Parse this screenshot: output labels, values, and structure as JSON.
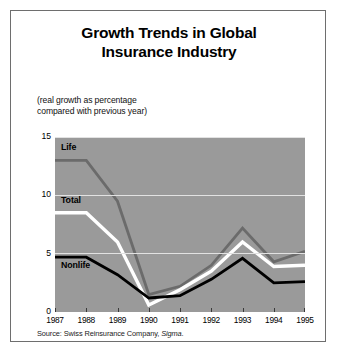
{
  "title_line1": "Growth Trends in Global",
  "title_line2": "Insurance Industry",
  "subtitle_line1": "(real growth as percentage",
  "subtitle_line2": "compared with previous year)",
  "source_prefix": "Source: Swiss Reinsurance Company, ",
  "source_italic": "Sigma",
  "source_suffix": ".",
  "labels": {
    "life": "Life",
    "total": "Total",
    "nonlife": "Nonlife"
  },
  "chart_data": {
    "type": "line",
    "title": "Growth Trends in Global Insurance Industry",
    "subtitle": "(real growth as percentage compared with previous year)",
    "xlabel": "",
    "ylabel": "",
    "categories": [
      "1987",
      "1988",
      "1989",
      "1990",
      "1991",
      "1992",
      "1993",
      "1994",
      "1995"
    ],
    "ylim": [
      0,
      15
    ],
    "yticks": [
      0,
      5,
      10,
      15
    ],
    "grid": true,
    "legend": "inline-labels",
    "plot_background": "#9a9a9a",
    "series": [
      {
        "name": "Life",
        "color": "#6b6b6b",
        "values": [
          13.0,
          13.0,
          9.5,
          1.5,
          2.2,
          4.0,
          7.2,
          4.3,
          5.2
        ]
      },
      {
        "name": "Total",
        "color": "#ffffff",
        "values": [
          8.5,
          8.5,
          6.0,
          0.6,
          1.9,
          3.5,
          6.0,
          3.9,
          4.0
        ]
      },
      {
        "name": "Nonlife",
        "color": "#000000",
        "values": [
          4.7,
          4.7,
          3.2,
          1.2,
          1.4,
          2.8,
          4.6,
          2.5,
          2.6
        ]
      }
    ],
    "source": "Source: Swiss Reinsurance Company, Sigma."
  }
}
